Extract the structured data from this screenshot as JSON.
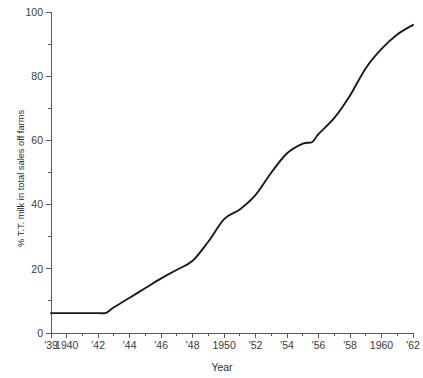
{
  "chart_data": {
    "type": "line",
    "title": "",
    "xlabel": "Year",
    "ylabel": "% T.T. milk in total sales off farms",
    "xlim": [
      1939,
      1962
    ],
    "ylim": [
      0,
      100
    ],
    "grid": false,
    "legend": "none",
    "x_tick_labels": [
      "'39",
      "1940",
      "'42",
      "'44",
      "'46",
      "'48",
      "1950",
      "'52",
      "'54",
      "'56",
      "'58",
      "1960",
      "'62"
    ],
    "x_tick_values": [
      1939,
      1940,
      1942,
      1944,
      1946,
      1948,
      1950,
      1952,
      1954,
      1956,
      1958,
      1960,
      1962
    ],
    "x_minor_tick_values": [
      1941,
      1943,
      1945,
      1947,
      1949,
      1951,
      1953,
      1955,
      1957,
      1959,
      1961
    ],
    "y_tick_labels": [
      "0",
      "20",
      "40",
      "60",
      "80",
      "100"
    ],
    "y_tick_values": [
      0,
      20,
      40,
      60,
      80,
      100
    ],
    "y_minor_tick_values": [
      10,
      30,
      50,
      70,
      90
    ],
    "series": [
      {
        "name": "% T.T. milk in total sales off farms",
        "color": "#1a1a1a",
        "x": [
          1939,
          1940,
          1941,
          1942,
          1942.5,
          1943,
          1944,
          1945,
          1946,
          1947,
          1948,
          1949,
          1950,
          1951,
          1952,
          1953,
          1954,
          1955,
          1955.6,
          1956,
          1957,
          1958,
          1959,
          1960,
          1961,
          1962
        ],
        "values": [
          6.2,
          6.2,
          6.2,
          6.2,
          6.3,
          8.0,
          11.0,
          14.0,
          17.0,
          19.7,
          22.5,
          28.5,
          35.5,
          38.5,
          43.0,
          50.0,
          56.0,
          59.0,
          59.5,
          62.0,
          67.0,
          74.0,
          82.5,
          88.5,
          93.0,
          96.0
        ]
      }
    ]
  },
  "figure": {
    "background": "#ffffff",
    "axis_color": "#5a5a5a",
    "line_color": "#1a1a1a"
  }
}
